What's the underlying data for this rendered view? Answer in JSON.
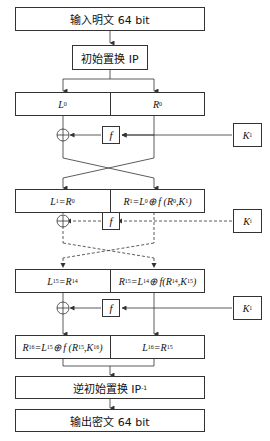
{
  "diagram": {
    "input_label": "输入明文 64 bit",
    "ip_label": "初始置换 IP",
    "inverse_ip_label": "逆初始置换 IP",
    "inverse_ip_sup": "-1",
    "output_label": "输出密文 64 bit",
    "f_label": "f",
    "round0": {
      "left": "L",
      "left_sub": "0",
      "right": "R",
      "right_sub": "0"
    },
    "round1": {
      "left_html": "L<sub>1</sub>=R<sub>0</sub>",
      "right_html": "R<sub>1</sub>=L<sub>0</sub> ⊕ f (R<sub>0</sub>,K<sub>1</sub>)"
    },
    "round15": {
      "left_html": "L<sub>15</sub>=R<sub>14</sub>",
      "right_html": "R<sub>15</sub>=L<sub>14</sub> ⊕ f(R<sub>14</sub>,K<sub>15</sub>)"
    },
    "round16": {
      "left_html": "R<sub>16</sub>=L<sub>15</sub> ⊕ f (R<sub>15</sub>,K<sub>16</sub>)",
      "right_html": "L<sub>16</sub>=R<sub>15</sub>"
    },
    "keys": [
      {
        "label": "K",
        "sub": "1"
      },
      {
        "label": "K",
        "sub": "i"
      },
      {
        "label": "K",
        "sub": "1"
      }
    ],
    "line_color": "#333333"
  }
}
